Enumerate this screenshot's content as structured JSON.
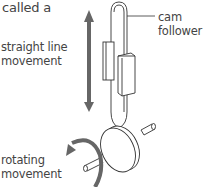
{
  "diagram": {
    "heading_fragment": "called a",
    "labels": {
      "straight_line": [
        "straight line",
        "movement"
      ],
      "cam_follower": [
        "cam",
        "follower"
      ],
      "rotating": [
        "rotating",
        "movement"
      ]
    },
    "colors": {
      "arrow": "#666666",
      "outline": "#333333",
      "text": "#444444"
    }
  }
}
